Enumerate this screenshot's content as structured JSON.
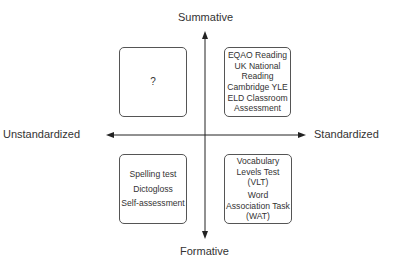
{
  "axes": {
    "top": "Summative",
    "bottom": "Formative",
    "left": "Unstandardized",
    "right": "Standardized"
  },
  "quadrants": {
    "top_left": {
      "items": [
        "?"
      ]
    },
    "top_right": {
      "items": [
        "EQAO Reading",
        "UK National",
        "Reading",
        "Cambridge YLE",
        "ELD Classroom",
        "Assessment"
      ]
    },
    "bottom_left": {
      "items": [
        "Spelling test",
        "Dictogloss",
        "Self-assessment"
      ]
    },
    "bottom_right": {
      "items": [
        "Vocabulary",
        "Levels Test (VLT)",
        "Word",
        "Association Task",
        "(WAT)"
      ]
    }
  },
  "colors": {
    "line": "#222222",
    "text": "#333333",
    "box_border": "#555555"
  }
}
